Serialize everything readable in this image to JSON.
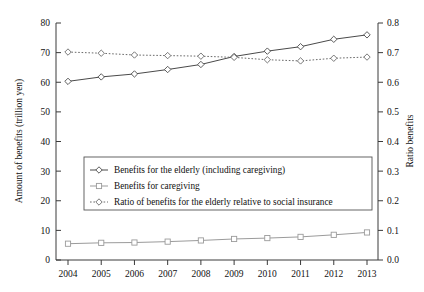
{
  "chart_data": {
    "type": "line",
    "title": "",
    "xlabel": "",
    "ylabel": "Amount of benefits (trillion yen)",
    "y2label": "Ratio benefits",
    "categories": [
      "2004",
      "2005",
      "2006",
      "2007",
      "2008",
      "2009",
      "2010",
      "2011",
      "2012",
      "2013"
    ],
    "x": [
      2004,
      2005,
      2006,
      2007,
      2008,
      2009,
      2010,
      2011,
      2012,
      2013
    ],
    "ylim": [
      0,
      80
    ],
    "y2lim": [
      0.0,
      0.8
    ],
    "yticks": [
      "0",
      "10",
      "20",
      "30",
      "40",
      "50",
      "60",
      "70",
      "80"
    ],
    "y2ticks": [
      "0.0",
      "0.1",
      "0.2",
      "0.3",
      "0.4",
      "0.5",
      "0.6",
      "0.7",
      "0.8"
    ],
    "grid": false,
    "legend_position": "center-left",
    "series": [
      {
        "name": "Benefits for the elderly (including caregiving)",
        "axis": "left",
        "style": "solid",
        "marker": "diamond",
        "color": "#4a4a4a",
        "values": [
          60.3,
          61.8,
          62.8,
          64.3,
          66.0,
          68.7,
          70.5,
          72.0,
          74.5,
          76.0
        ]
      },
      {
        "name": "Benefits for caregiving",
        "axis": "left",
        "style": "solid",
        "marker": "square",
        "color": "#9b9b9b",
        "values": [
          5.5,
          5.8,
          5.9,
          6.2,
          6.6,
          7.1,
          7.4,
          7.8,
          8.5,
          9.3
        ]
      },
      {
        "name": "Ratio of benefits for the elderly relative to social insurance",
        "axis": "right",
        "style": "dotted",
        "marker": "diamond",
        "color": "#6a6a6a",
        "values": [
          0.702,
          0.698,
          0.692,
          0.69,
          0.688,
          0.684,
          0.676,
          0.672,
          0.681,
          0.685
        ]
      }
    ]
  },
  "legend": {
    "items": [
      {
        "label": "Benefits for the elderly (including caregiving)",
        "marker": "diamond",
        "style": "solid"
      },
      {
        "label": "Benefits for caregiving",
        "marker": "square",
        "style": "solid"
      },
      {
        "label": "Ratio of benefits for the elderly relative to social insurance",
        "marker": "diamond",
        "style": "dotted"
      }
    ]
  }
}
